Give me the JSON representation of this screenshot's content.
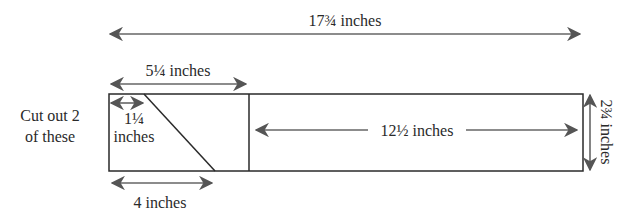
{
  "diagram": {
    "side_note": [
      "Cut out 2",
      "of these"
    ],
    "dimensions": {
      "total_length": "17¾ inches",
      "left_section": "5¼ inches",
      "top_offset": [
        "1¼",
        "inches"
      ],
      "bottom_offset": "4 inches",
      "right_section": "12½ inches",
      "height": "2¾ inches"
    },
    "colors": {
      "line": "#2a2a2a",
      "arrow": "#555555",
      "text": "#2a2a2a"
    }
  }
}
